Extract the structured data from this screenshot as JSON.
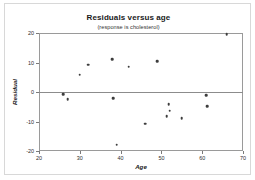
{
  "chart_data": {
    "type": "scatter",
    "title": "Residuals versus age",
    "subtitle": "(response is cholesterol)",
    "xlabel": "Age",
    "ylabel": "Residual",
    "xlim": [
      20,
      70
    ],
    "ylim": [
      -20,
      20
    ],
    "xticks": [
      20,
      30,
      40,
      50,
      60,
      70
    ],
    "yticks": [
      20,
      10,
      0,
      -10,
      -20
    ],
    "grid": false,
    "legend": null,
    "reference_line": 0,
    "point_color": "#3d3d3d",
    "axis_color": "#9a9a9a",
    "points": [
      {
        "x": 26.0,
        "y": -0.7
      },
      {
        "x": 27.0,
        "y": -2.4
      },
      {
        "x": 30.0,
        "y": 5.9
      },
      {
        "x": 32.0,
        "y": 9.3
      },
      {
        "x": 38.0,
        "y": 11.2
      },
      {
        "x": 38.2,
        "y": -2.2
      },
      {
        "x": 39.0,
        "y": -17.8
      },
      {
        "x": 42.0,
        "y": 8.6
      },
      {
        "x": 46.0,
        "y": -10.8
      },
      {
        "x": 49.0,
        "y": 10.5
      },
      {
        "x": 51.3,
        "y": -8.2
      },
      {
        "x": 51.8,
        "y": -4.1
      },
      {
        "x": 52.0,
        "y": -6.3
      },
      {
        "x": 55.0,
        "y": -8.9
      },
      {
        "x": 61.0,
        "y": -1.1
      },
      {
        "x": 61.2,
        "y": -4.9
      },
      {
        "x": 66.0,
        "y": 19.6
      }
    ]
  }
}
